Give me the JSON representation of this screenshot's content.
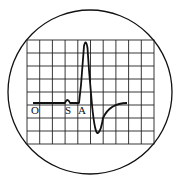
{
  "figure": {
    "type": "oscilloscope-screen",
    "grid": {
      "columns": 10,
      "rows": 8
    },
    "labels": [
      {
        "id": "O",
        "text": "O"
      },
      {
        "id": "S",
        "text": "S"
      },
      {
        "id": "A",
        "text": "A"
      }
    ],
    "colors": {
      "line": "#111111",
      "grid": "#222222",
      "background": "#ffffff"
    }
  }
}
